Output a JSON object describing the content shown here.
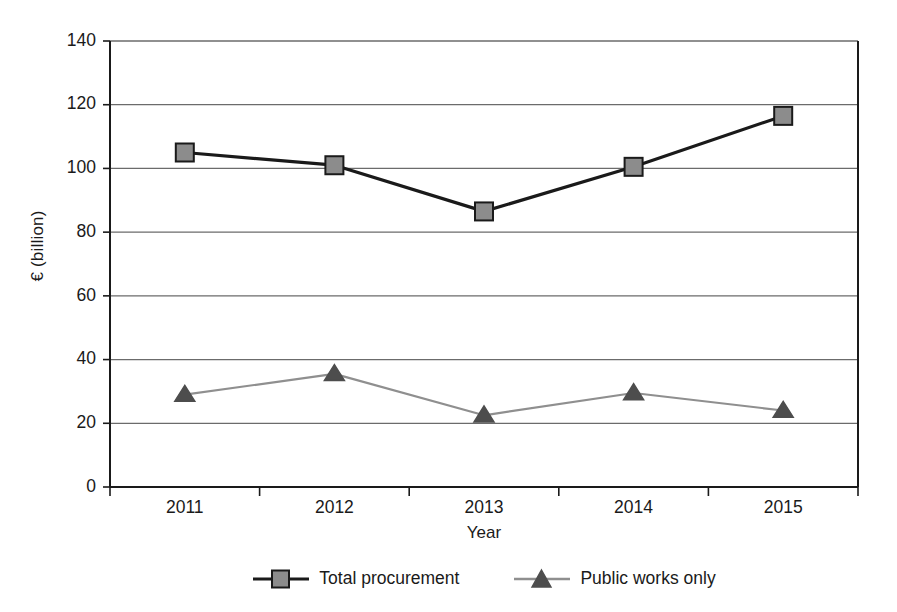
{
  "chart_data": {
    "type": "line",
    "title": "",
    "xlabel": "Year",
    "ylabel": "€ (billion)",
    "categories": [
      "2011",
      "2012",
      "2013",
      "2014",
      "2015"
    ],
    "ylim": [
      0,
      140
    ],
    "yticks": [
      0,
      20,
      40,
      60,
      80,
      100,
      120,
      140
    ],
    "ytick_labels": [
      "0",
      "20",
      "40",
      "60",
      "80",
      "100",
      "120",
      "140"
    ],
    "grid": "horizontal",
    "legend_position": "bottom-center",
    "series": [
      {
        "name": "Total procurement",
        "marker": "square",
        "marker_fill": "#8c8c8c",
        "marker_stroke": "#1a1a1a",
        "line_color": "#1a1a1a",
        "values": [
          105,
          101,
          86.5,
          100.5,
          116.5
        ]
      },
      {
        "name": "Public works only",
        "marker": "triangle",
        "marker_fill": "#4d4d4d",
        "marker_stroke": "#4d4d4d",
        "line_color": "#8f8f8f",
        "values": [
          29,
          35.5,
          22.5,
          29.5,
          24
        ]
      }
    ]
  },
  "colors": {
    "axis": "#1a1a1a",
    "gridline": "#6b6b6b",
    "background": "#ffffff",
    "series_total": "#1a1a1a",
    "series_public_works": "#8f8f8f",
    "marker_square_fill": "#8c8c8c",
    "marker_triangle_fill": "#4d4d4d"
  },
  "legend": {
    "entries": [
      {
        "label": "Total procurement",
        "icon": "square-marker-icon"
      },
      {
        "label": "Public works only",
        "icon": "triangle-marker-icon"
      }
    ]
  }
}
